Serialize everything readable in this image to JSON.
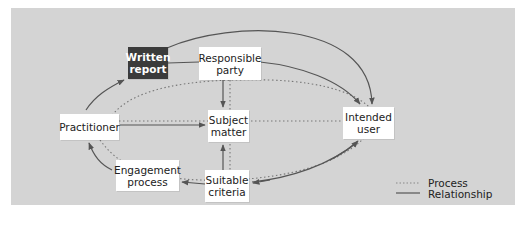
{
  "diagram": {
    "colors": {
      "panel_background": "#d4d4d4",
      "page_background": "#ffffff",
      "node_background": "#ffffff",
      "highlight_node_background": "#3b3b3b",
      "line_color": "#555555",
      "dotted_color": "#777777"
    },
    "nodes": {
      "written_report": {
        "line1": "Written",
        "line2": "report",
        "style": "dark"
      },
      "responsible_party": {
        "line1": "Responsible",
        "line2": "party"
      },
      "practitioner": {
        "line1": "Practitioner"
      },
      "subject_matter": {
        "line1": "Subject",
        "line2": "matter"
      },
      "intended_user": {
        "line1": "Intended",
        "line2": "user"
      },
      "engagement_process": {
        "line1": "Engagement",
        "line2": "process"
      },
      "suitable_criteria": {
        "line1": "Suitable",
        "line2": "criteria"
      }
    },
    "edges": [
      {
        "from": "Practitioner",
        "to": "Written report",
        "type": "relationship",
        "arrow": true
      },
      {
        "from": "Written report",
        "to": "Intended user",
        "type": "relationship",
        "arrow": true
      },
      {
        "from": "Responsible party",
        "to": "Intended user",
        "type": "relationship",
        "arrow": true
      },
      {
        "from": "Written report",
        "to": "Responsible party",
        "type": "relationship",
        "arrow": false
      },
      {
        "from": "Responsible party",
        "to": "Subject matter",
        "type": "relationship",
        "arrow": true
      },
      {
        "from": "Practitioner",
        "to": "Subject matter",
        "type": "relationship",
        "arrow": true
      },
      {
        "from": "Suitable criteria",
        "to": "Subject matter",
        "type": "relationship",
        "arrow": true
      },
      {
        "from": "Suitable criteria",
        "to": "Engagement process",
        "type": "relationship",
        "arrow": true
      },
      {
        "from": "Engagement process",
        "to": "Practitioner",
        "type": "relationship",
        "arrow": true
      },
      {
        "from": "Intended user",
        "to": "Suitable criteria",
        "type": "relationship",
        "arrow": true
      },
      {
        "from": "Practitioner",
        "to": "Intended user",
        "type": "process",
        "arrow": false
      },
      {
        "from": "Responsible party",
        "to": "Suitable criteria",
        "type": "process",
        "arrow": false
      },
      {
        "from": "Outer loop",
        "to": "Outer loop",
        "type": "process",
        "arrow": false
      }
    ],
    "legend": {
      "process_label": "Process",
      "relationship_label": "Relationship"
    }
  }
}
